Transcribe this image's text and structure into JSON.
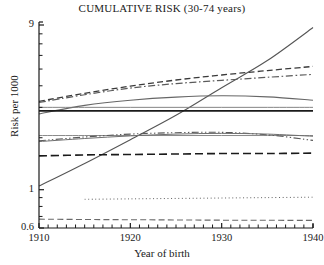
{
  "chart_data": {
    "type": "line",
    "title": "CUMULATIVE RISK (30-74 years)",
    "xlabel": "Year of birth",
    "ylabel": "Risk per 1000",
    "xlim": [
      1910,
      1940
    ],
    "ylim": [
      0.6,
      9
    ],
    "yscale": "log",
    "xscale": "linear",
    "grid": false,
    "legend": "none",
    "xticks": [
      1910,
      1920,
      1930,
      1940
    ],
    "xtick_labels": [
      "1910",
      "1920",
      "1930",
      "1940"
    ],
    "xminor_step": 1,
    "yticks": [
      0.6,
      0.7,
      0.8,
      0.9,
      1,
      2,
      3,
      4,
      5,
      6,
      7,
      8,
      9
    ],
    "ytick_labels": [
      "0.6",
      "",
      "",
      "",
      "1",
      "",
      "",
      "",
      "",
      "",
      "",
      "",
      "9"
    ],
    "x": [
      1910,
      1915,
      1920,
      1925,
      1930,
      1935,
      1940
    ],
    "series": [
      {
        "name": "steep-rising-solid",
        "style": "solid",
        "color": "#555555",
        "width": 1.1,
        "values": [
          1.05,
          1.42,
          1.95,
          2.7,
          3.9,
          5.6,
          8.7
        ]
      },
      {
        "name": "upper-dashed",
        "style": "dashed",
        "color": "#3a3a3a",
        "width": 1.3,
        "values": [
          3.25,
          3.62,
          3.98,
          4.32,
          4.62,
          4.9,
          5.18
        ]
      },
      {
        "name": "upper-dashdot",
        "style": "dashdot",
        "color": "#5a5a5a",
        "width": 1.2,
        "values": [
          3.2,
          3.55,
          3.88,
          4.12,
          4.3,
          4.48,
          4.66
        ]
      },
      {
        "name": "arch-solid",
        "style": "solid",
        "color": "#666666",
        "width": 1.1,
        "values": [
          2.75,
          3.08,
          3.3,
          3.44,
          3.5,
          3.45,
          3.3
        ]
      },
      {
        "name": "flat-thin-solid",
        "style": "solid",
        "color": "#777777",
        "width": 0.9,
        "values": [
          3.0,
          3.0,
          3.0,
          3.0,
          3.0,
          3.0,
          3.0
        ]
      },
      {
        "name": "flat-thick-solid",
        "style": "solid",
        "color": "#1a1a1a",
        "width": 1.8,
        "values": [
          2.86,
          2.86,
          2.86,
          2.86,
          2.86,
          2.86,
          2.86
        ]
      },
      {
        "name": "mid-flat-gray",
        "style": "solid",
        "color": "#8a8a8a",
        "width": 1.0,
        "values": [
          2.06,
          2.06,
          2.06,
          2.06,
          2.06,
          2.06,
          2.06
        ]
      },
      {
        "name": "mid-dashdotdot",
        "style": "dashdotdot",
        "color": "#5a5a5a",
        "width": 1.1,
        "values": [
          1.92,
          2.02,
          2.1,
          2.14,
          2.15,
          2.08,
          1.93
        ]
      },
      {
        "name": "mid-rising-solid",
        "style": "solid",
        "color": "#6f6f6f",
        "width": 1.0,
        "values": [
          1.9,
          1.98,
          2.05,
          2.1,
          2.12,
          2.1,
          2.04
        ]
      },
      {
        "name": "lower-heavy-dashed",
        "style": "longdash",
        "color": "#1a1a1a",
        "width": 1.6,
        "values": [
          1.57,
          1.59,
          1.6,
          1.61,
          1.62,
          1.62,
          1.63
        ]
      },
      {
        "name": "dotted-flat",
        "style": "dotted",
        "color": "#606060",
        "width": 1.0,
        "values": [
          null,
          0.88,
          0.885,
          0.89,
          0.895,
          0.9,
          0.905
        ]
      },
      {
        "name": "bottom-dashed",
        "style": "dashed",
        "color": "#6a6a6a",
        "width": 1.1,
        "values": [
          0.675,
          0.672,
          0.67,
          0.668,
          0.666,
          0.665,
          0.664
        ]
      }
    ]
  },
  "axes": {
    "title": "CUMULATIVE RISK (30-74 years)",
    "xlabel": "Year of birth",
    "ylabel": "Risk per 1000"
  }
}
